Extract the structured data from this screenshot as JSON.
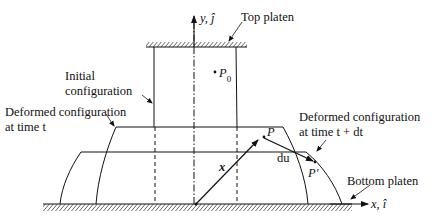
{
  "diagram": {
    "type": "continuum-mechanics-deformation-schematic",
    "axes": {
      "y_label": "y, ĵ",
      "x_label": "x, î"
    },
    "labels": {
      "top_platen": "Top platen",
      "bottom_platen": "Bottom platen",
      "initial_config_line1": "Initial",
      "initial_config_line2": "configuration",
      "deformed_t_line1": "Deformed configuration",
      "deformed_t_line2": "at time t",
      "deformed_tdt_line1": "Deformed configuration",
      "deformed_tdt_line2": "at time t + dt"
    },
    "points": {
      "p0": "P",
      "p0_sub": "0",
      "p": "P",
      "p_prime": "P′"
    },
    "vectors": {
      "position": "x",
      "displacement_increment": "du"
    },
    "colors": {
      "stroke": "#111111",
      "background": "#ffffff"
    }
  }
}
